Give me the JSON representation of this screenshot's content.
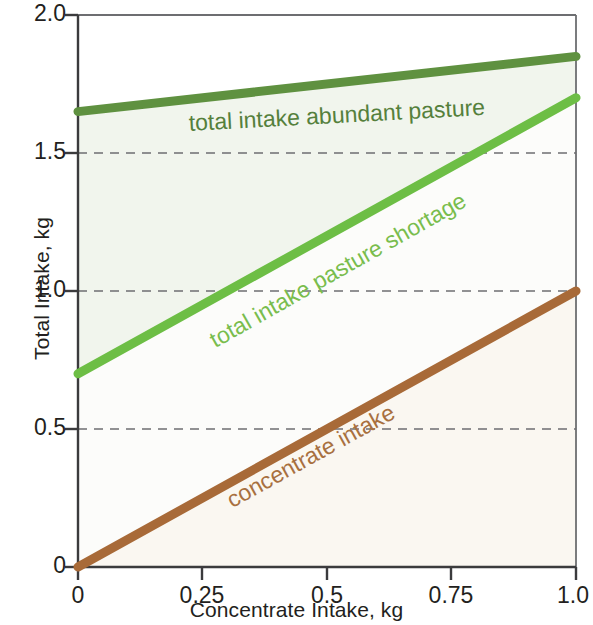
{
  "chart_data": {
    "type": "line",
    "title": "",
    "xlabel": "Concentrate Intake, kg",
    "ylabel": "Total Intake, kg",
    "xlim": [
      0,
      1.0
    ],
    "ylim": [
      0,
      2.0
    ],
    "xticks": [
      "0",
      "0.25",
      "0.5",
      "0.75",
      "1.0"
    ],
    "xtick_values": [
      0,
      0.25,
      0.5,
      0.75,
      1.0
    ],
    "yticks": [
      "0",
      "0.5",
      "1.0",
      "1.5",
      "2.0"
    ],
    "ytick_values": [
      0,
      0.5,
      1.0,
      1.5,
      2.0
    ],
    "grid": "horizontal dashed at 0.5, 1.0, 1.5",
    "gridlines_y": [
      0.5,
      1.0,
      1.5
    ],
    "legend_position": "inline labels on curves",
    "x": [
      0,
      1.0
    ],
    "series": [
      {
        "name": "total intake abundant pasture",
        "values": [
          1.65,
          1.85
        ],
        "color": "#5f9140"
      },
      {
        "name": "total intake pasture shortage",
        "values": [
          0.7,
          1.7
        ],
        "color": "#6dbe45"
      },
      {
        "name": "concentrate intake",
        "values": [
          0.0,
          1.0
        ],
        "color": "#a86a38"
      }
    ]
  },
  "axes": {
    "x_title": "Concentrate Intake, kg",
    "y_title": "Total Intake, kg",
    "x_tick_labels": [
      "0",
      "0.25",
      "0.5",
      "0.75",
      "1.0"
    ],
    "y_tick_labels": [
      "0",
      "0.5",
      "1.0",
      "1.5",
      "2.0"
    ]
  },
  "curve_labels": {
    "abundant_pasture": "total intake abundant pasture",
    "pasture_shortage": "total intake pasture shortage",
    "concentrate_intake": "concentrate intake"
  },
  "colors": {
    "dark_green": "#5f9140",
    "light_green": "#6dbe45",
    "brown": "#a86a38",
    "axis": "#58595b",
    "gridline": "#6d6e71",
    "text": "#231f20",
    "fill_green": "#f2f6ef",
    "fill_brown": "#faf7f2"
  }
}
